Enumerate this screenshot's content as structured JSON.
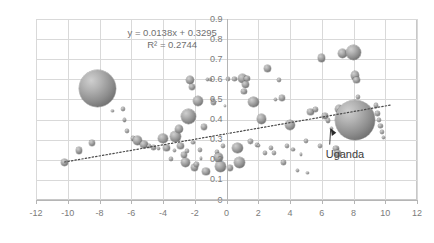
{
  "chart_data": {
    "type": "scatter",
    "title": "",
    "xlabel": "",
    "ylabel": "",
    "xlim": [
      -12,
      12
    ],
    "ylim": [
      0,
      0.9
    ],
    "grid": true,
    "legend": false,
    "x_ticks": [
      "-12",
      "-10",
      "-8",
      "-6",
      "-4",
      "-2",
      "0",
      "2",
      "4",
      "6",
      "8",
      "10",
      "12"
    ],
    "y_ticks": [
      "0",
      "0.1",
      "0.2",
      "0.3",
      "0.4",
      "0.5",
      "0.6",
      "0.7",
      "0.8",
      "0.9"
    ],
    "trendline": {
      "equation": "y = 0.0138x + 0.3295",
      "r_squared": "R² = 0.2744",
      "slope": 0.0138,
      "intercept": 0.3295,
      "style": "dotted",
      "x_start": -10.2,
      "x_end": 10.4
    },
    "annotations": [
      {
        "label": "Uganda",
        "point_x": 6.5,
        "point_y": 0.38
      }
    ],
    "bubble_color": "#8e8e8e",
    "points": [
      {
        "x": -10.2,
        "y": 0.188,
        "r": 3.4
      },
      {
        "x": -9.3,
        "y": 0.246,
        "r": 3.2
      },
      {
        "x": -8.5,
        "y": 0.283,
        "r": 3.0
      },
      {
        "x": -8.1,
        "y": 0.555,
        "r": 18.5
      },
      {
        "x": -6.5,
        "y": 0.452,
        "r": 1.9
      },
      {
        "x": -6.4,
        "y": 0.398,
        "r": 1.6
      },
      {
        "x": -6.3,
        "y": 0.345,
        "r": 2.0
      },
      {
        "x": -5.9,
        "y": 0.307,
        "r": 2.3
      },
      {
        "x": -5.6,
        "y": 0.296,
        "r": 4.2
      },
      {
        "x": -5.2,
        "y": 0.276,
        "r": 3.6
      },
      {
        "x": -4.9,
        "y": 0.268,
        "r": 2.0
      },
      {
        "x": -4.6,
        "y": 0.262,
        "r": 2.6
      },
      {
        "x": -4.3,
        "y": 0.255,
        "r": 1.5
      },
      {
        "x": -4.0,
        "y": 0.306,
        "r": 4.6
      },
      {
        "x": -3.8,
        "y": 0.258,
        "r": 3.4
      },
      {
        "x": -3.5,
        "y": 0.205,
        "r": 2.0
      },
      {
        "x": -3.3,
        "y": 0.248,
        "r": 1.6
      },
      {
        "x": -3.2,
        "y": 0.316,
        "r": 5.8
      },
      {
        "x": -3.0,
        "y": 0.355,
        "r": 4.0
      },
      {
        "x": -2.9,
        "y": 0.268,
        "r": 3.2
      },
      {
        "x": -2.7,
        "y": 0.222,
        "r": 3.0
      },
      {
        "x": -2.6,
        "y": 0.188,
        "r": 4.4
      },
      {
        "x": -2.5,
        "y": 0.243,
        "r": 2.2
      },
      {
        "x": -2.4,
        "y": 0.415,
        "r": 7.4
      },
      {
        "x": -2.3,
        "y": 0.598,
        "r": 4.0
      },
      {
        "x": -2.2,
        "y": 0.56,
        "r": 3.0
      },
      {
        "x": -2.1,
        "y": 0.286,
        "r": 1.8
      },
      {
        "x": -2.0,
        "y": 0.163,
        "r": 3.6
      },
      {
        "x": -1.9,
        "y": 0.178,
        "r": 2.4
      },
      {
        "x": -1.8,
        "y": 0.492,
        "r": 5.4
      },
      {
        "x": -1.7,
        "y": 0.251,
        "r": 2.0
      },
      {
        "x": -1.6,
        "y": 0.205,
        "r": 1.4
      },
      {
        "x": -1.4,
        "y": 0.362,
        "r": 3.0
      },
      {
        "x": -1.3,
        "y": 0.142,
        "r": 3.8
      },
      {
        "x": -1.2,
        "y": 0.601,
        "r": 1.6
      },
      {
        "x": -1.0,
        "y": 0.6,
        "r": 1.7
      },
      {
        "x": -0.9,
        "y": 0.5,
        "r": 1.5
      },
      {
        "x": -0.8,
        "y": 0.487,
        "r": 2.6
      },
      {
        "x": -0.6,
        "y": 0.237,
        "r": 2.0
      },
      {
        "x": -0.5,
        "y": 0.212,
        "r": 4.2
      },
      {
        "x": -0.4,
        "y": 0.168,
        "r": 5.6
      },
      {
        "x": -0.2,
        "y": 0.268,
        "r": 2.2
      },
      {
        "x": 0.1,
        "y": 0.601,
        "r": 2.4
      },
      {
        "x": 0.5,
        "y": 0.601,
        "r": 2.2
      },
      {
        "x": 0.7,
        "y": 0.26,
        "r": 5.2
      },
      {
        "x": 0.8,
        "y": 0.186,
        "r": 5.6
      },
      {
        "x": 1.0,
        "y": 0.602,
        "r": 4.6
      },
      {
        "x": 1.2,
        "y": 0.575,
        "r": 3.4
      },
      {
        "x": 1.3,
        "y": 0.604,
        "r": 2.8
      },
      {
        "x": 1.1,
        "y": 0.54,
        "r": 2.6
      },
      {
        "x": 1.5,
        "y": 0.292,
        "r": 2.4
      },
      {
        "x": 1.7,
        "y": 0.486,
        "r": 5.2
      },
      {
        "x": 1.9,
        "y": 0.275,
        "r": 1.9
      },
      {
        "x": 2.2,
        "y": 0.403,
        "r": 4.8
      },
      {
        "x": 2.4,
        "y": 0.232,
        "r": 2.0
      },
      {
        "x": 2.6,
        "y": 0.656,
        "r": 3.6
      },
      {
        "x": 2.8,
        "y": 0.258,
        "r": 2.4
      },
      {
        "x": 3.0,
        "y": 0.233,
        "r": 2.2
      },
      {
        "x": 3.1,
        "y": 0.5,
        "r": 1.5
      },
      {
        "x": 3.3,
        "y": 0.598,
        "r": 2.0
      },
      {
        "x": 3.5,
        "y": 0.508,
        "r": 3.0
      },
      {
        "x": 3.6,
        "y": 0.188,
        "r": 2.6
      },
      {
        "x": 3.8,
        "y": 0.268,
        "r": 2.0
      },
      {
        "x": 4.0,
        "y": 0.372,
        "r": 5.2
      },
      {
        "x": 4.2,
        "y": 0.252,
        "r": 1.8
      },
      {
        "x": 4.5,
        "y": 0.148,
        "r": 1.6
      },
      {
        "x": 4.7,
        "y": 0.226,
        "r": 1.4
      },
      {
        "x": 5.0,
        "y": 0.295,
        "r": 2.0
      },
      {
        "x": 5.3,
        "y": 0.438,
        "r": 3.2
      },
      {
        "x": 5.6,
        "y": 0.452,
        "r": 2.6
      },
      {
        "x": 5.9,
        "y": 0.268,
        "r": 2.2
      },
      {
        "x": 6.0,
        "y": 0.705,
        "r": 3.8
      },
      {
        "x": 6.2,
        "y": 0.418,
        "r": 2.8
      },
      {
        "x": 6.4,
        "y": 0.396,
        "r": 2.4
      },
      {
        "x": 6.6,
        "y": 0.355,
        "r": 1.8
      },
      {
        "x": 6.9,
        "y": 0.258,
        "r": 2.6
      },
      {
        "x": 7.1,
        "y": 0.452,
        "r": 4.2
      },
      {
        "x": 7.3,
        "y": 0.73,
        "r": 4.6
      },
      {
        "x": 8.1,
        "y": 0.398,
        "r": 20.0
      },
      {
        "x": 8.0,
        "y": 0.735,
        "r": 7.6
      },
      {
        "x": 8.1,
        "y": 0.62,
        "r": 4.4
      },
      {
        "x": 8.2,
        "y": 0.596,
        "r": 3.4
      },
      {
        "x": 8.3,
        "y": 0.512,
        "r": 2.0
      },
      {
        "x": 9.4,
        "y": 0.47,
        "r": 2.2
      },
      {
        "x": 9.5,
        "y": 0.43,
        "r": 2.6
      },
      {
        "x": 9.6,
        "y": 0.398,
        "r": 2.0
      },
      {
        "x": 9.7,
        "y": 0.368,
        "r": 2.4
      },
      {
        "x": 9.8,
        "y": 0.338,
        "r": 2.0
      },
      {
        "x": 9.9,
        "y": 0.312,
        "r": 1.8
      },
      {
        "x": 7.0,
        "y": 0.232,
        "r": 3.4
      },
      {
        "x": 5.1,
        "y": 0.135,
        "r": 1.2
      },
      {
        "x": 2.0,
        "y": 0.272,
        "r": 1.6
      },
      {
        "x": 0.2,
        "y": 0.16,
        "r": 3.2
      },
      {
        "x": -7.2,
        "y": 0.442,
        "r": 1.4
      },
      {
        "x": -0.1,
        "y": 0.468,
        "r": 1.3
      }
    ]
  }
}
